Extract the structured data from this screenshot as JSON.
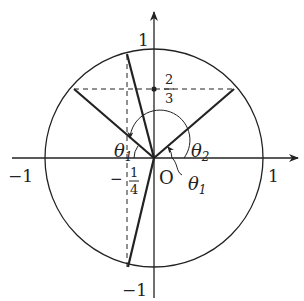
{
  "diagram": {
    "type": "unit-circle",
    "origin_label": "O",
    "axes": {
      "x_ticks": [
        {
          "value": -1,
          "label": "−1"
        },
        {
          "value": 1,
          "label": "1"
        }
      ],
      "y_ticks": [
        {
          "value": 1,
          "label": "1"
        },
        {
          "value": -1,
          "label": "−1"
        }
      ]
    },
    "guides": {
      "horizontal_line": {
        "value": "2/3",
        "numerator": "2",
        "denominator": "3"
      },
      "vertical_line": {
        "value": "-1/4",
        "sign": "−",
        "numerator": "1",
        "denominator": "4"
      }
    },
    "angles": [
      {
        "name": "theta1_left",
        "label": "θ",
        "subscript": "1"
      },
      {
        "name": "theta2",
        "label": "θ",
        "subscript": "2"
      },
      {
        "name": "theta1_right",
        "label": "θ",
        "subscript": "1"
      }
    ],
    "colors": {
      "stroke": "#222222",
      "background": "#ffffff"
    }
  }
}
